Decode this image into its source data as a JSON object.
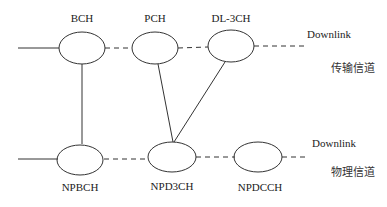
{
  "transport_row": {
    "nodes": [
      {
        "label": "BCH"
      },
      {
        "label": "PCH"
      },
      {
        "label": "DL-3CH"
      }
    ],
    "direction_label": "Downlink",
    "layer_label": "传输信道"
  },
  "physical_row": {
    "nodes": [
      {
        "label": "NPBCH"
      },
      {
        "label": "NPD3CH"
      },
      {
        "label": "NPDCCH"
      }
    ],
    "direction_label": "Downlink",
    "layer_label": "物理信道"
  },
  "mappings": [
    {
      "from": "BCH",
      "to": "NPBCH"
    },
    {
      "from": "PCH",
      "to": "NPD3CH"
    },
    {
      "from": "DL-3CH",
      "to": "NPD3CH"
    }
  ],
  "colors": {
    "stroke": "#333333",
    "text": "#222222",
    "background": "#ffffff"
  }
}
